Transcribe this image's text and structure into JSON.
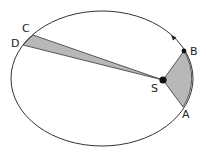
{
  "diagram": {
    "colors": {
      "stroke": "#333333",
      "sector_fill": "#b8b8b8",
      "background": "#ffffff"
    },
    "orbit": {
      "cx": 102,
      "cy": 78.5,
      "rx": 91,
      "ry": 67.5
    },
    "sun": {
      "label": "S",
      "x": 163,
      "y": 80,
      "r": 3.6
    },
    "points": [
      {
        "id": "A",
        "label": "A",
        "x": 183,
        "y": 107,
        "lx": 182,
        "ly": 118
      },
      {
        "id": "B",
        "label": "B",
        "x": 184,
        "y": 51,
        "lx": 190,
        "ly": 55
      },
      {
        "id": "C",
        "label": "C",
        "x": 33,
        "y": 35,
        "lx": 22,
        "ly": 32
      },
      {
        "id": "D",
        "label": "D",
        "x": 23,
        "y": 45,
        "lx": 11,
        "ly": 47
      }
    ],
    "sectors": [
      {
        "name": "sector-AB",
        "from": "A",
        "to": "B"
      },
      {
        "name": "sector-CD",
        "from": "C",
        "to": "D"
      }
    ],
    "direction_arrow": {
      "x": 172,
      "y": 36,
      "label": "orbit direction"
    },
    "sun_label_pos": {
      "x": 151,
      "y": 92
    }
  }
}
